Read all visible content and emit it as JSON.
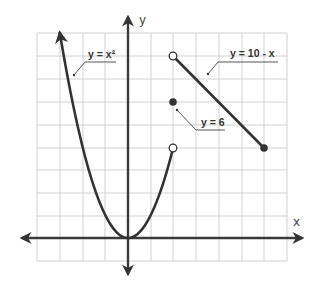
{
  "diagram": {
    "type": "piecewise-function-graph",
    "axes": {
      "x_label": "x",
      "y_label": "y",
      "x_range": [
        -4,
        7
      ],
      "y_range": [
        -1,
        9
      ],
      "grid": true,
      "grid_step": 1
    },
    "pieces": [
      {
        "name": "parabola",
        "label": "y = x²",
        "formula": "y = x^2",
        "domain": "x < 2",
        "left_end": "arrow",
        "right_end": {
          "x": 2,
          "y": 4,
          "style": "open"
        }
      },
      {
        "name": "point",
        "label": "y = 6",
        "formula": "y = 6",
        "domain": "x = 2",
        "point": {
          "x": 2,
          "y": 6,
          "style": "closed"
        }
      },
      {
        "name": "line",
        "label": "y = 10 - x",
        "formula": "y = 10 - x",
        "domain": "2 < x ≤ 6",
        "left_end": {
          "x": 2,
          "y": 8,
          "style": "open"
        },
        "right_end": {
          "x": 6,
          "y": 4,
          "style": "closed"
        }
      }
    ],
    "colors": {
      "ink": "#333333",
      "grid": "#d0d0d0",
      "background": "#ffffff"
    }
  }
}
